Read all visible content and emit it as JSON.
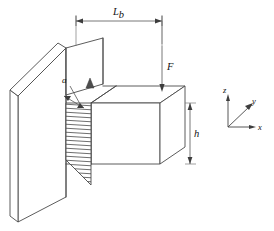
{
  "figure": {
    "kind": "engineering-diagram",
    "background_color": "#ffffff",
    "line_color": "#4a4a4a",
    "hatch_color": "#3d3d3d"
  },
  "labels": {
    "span": "L",
    "span_subscript": "b",
    "force": "F",
    "height": "h",
    "crack": "a"
  },
  "axes": {
    "z": "z",
    "y": "y",
    "x": "x"
  },
  "dimensions": {
    "span_label_full": "Lb",
    "height_label_full": "h"
  },
  "icons": {
    "force_arrow": "arrow-down-icon",
    "crack_arrow": "double-arrow-icon",
    "support_marker": "triangle-support-icon",
    "axis_z": "axis-arrow-up-icon",
    "axis_y": "axis-arrow-diagonal-icon",
    "axis_x": "axis-arrow-right-icon"
  }
}
